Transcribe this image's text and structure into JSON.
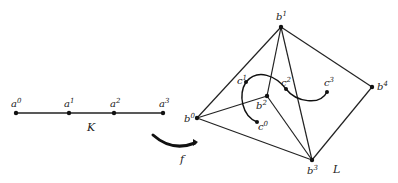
{
  "figure": {
    "complex_K": {
      "label": "K",
      "vertices": [
        {
          "name": "a",
          "sup": "0"
        },
        {
          "name": "a",
          "sup": "1"
        },
        {
          "name": "a",
          "sup": "2"
        },
        {
          "name": "a",
          "sup": "3"
        }
      ]
    },
    "map_label": "f",
    "complex_L": {
      "label": "L",
      "vertices": [
        {
          "name": "b",
          "sup": "0"
        },
        {
          "name": "b",
          "sup": "1"
        },
        {
          "name": "b",
          "sup": "2"
        },
        {
          "name": "b",
          "sup": "3"
        },
        {
          "name": "b",
          "sup": "4"
        }
      ],
      "path_points": [
        {
          "name": "c",
          "sup": "0"
        },
        {
          "name": "c",
          "sup": "1"
        },
        {
          "name": "c",
          "sup": "2"
        },
        {
          "name": "c",
          "sup": "3"
        }
      ]
    }
  }
}
